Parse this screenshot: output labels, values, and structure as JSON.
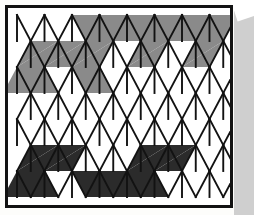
{
  "figure": {
    "title": "Triangular lattice grid with shaded regions",
    "type": "triangular-grid",
    "columns": 8,
    "rows": 7,
    "background_color": "#ffffff",
    "line_color": "#121212",
    "frame_color": "#121212",
    "page_color": "#fdfdfb",
    "scan_gutter_color": "#cfcfcf",
    "shade_colors": {
      "gray": "#8a8a8a",
      "dark": "#2b2b2b",
      "empty": "#ffffff"
    },
    "geometry": {
      "origin_x": 14,
      "origin_y": 12,
      "cell_width": 27.5,
      "cell_height": 26.0,
      "stroke_width": 1.9,
      "frame_x": 5,
      "frame_y": 5,
      "frame_width": 228,
      "frame_height": 203,
      "frame_stroke": 3
    },
    "legend": [
      {
        "key": "gray",
        "label": "Gray shaded triangle",
        "color": "#8a8a8a"
      },
      {
        "key": "dark",
        "label": "Dark shaded triangle",
        "color": "#2b2b2b"
      },
      {
        "key": "empty",
        "label": "Unshaded triangle",
        "color": "#ffffff"
      }
    ],
    "shaded_cells": [
      {
        "row": 0,
        "col": 2,
        "dir": "up",
        "shade": "gray"
      },
      {
        "row": 0,
        "col": 3,
        "dir": "down",
        "shade": "gray"
      },
      {
        "row": 0,
        "col": 3,
        "dir": "up",
        "shade": "gray"
      },
      {
        "row": 0,
        "col": 4,
        "dir": "down",
        "shade": "gray"
      },
      {
        "row": 0,
        "col": 4,
        "dir": "up",
        "shade": "gray"
      },
      {
        "row": 0,
        "col": 5,
        "dir": "down",
        "shade": "gray"
      },
      {
        "row": 0,
        "col": 5,
        "dir": "up",
        "shade": "gray"
      },
      {
        "row": 0,
        "col": 6,
        "dir": "down",
        "shade": "gray"
      },
      {
        "row": 0,
        "col": 6,
        "dir": "up",
        "shade": "gray"
      },
      {
        "row": 0,
        "col": 7,
        "dir": "down",
        "shade": "gray"
      },
      {
        "row": 0,
        "col": 7,
        "dir": "up",
        "shade": "gray"
      },
      {
        "row": 1,
        "col": 0,
        "dir": "up",
        "shade": "gray"
      },
      {
        "row": 1,
        "col": 1,
        "dir": "down",
        "shade": "gray"
      },
      {
        "row": 1,
        "col": 1,
        "dir": "up",
        "shade": "gray"
      },
      {
        "row": 1,
        "col": 2,
        "dir": "down",
        "shade": "gray"
      },
      {
        "row": 1,
        "col": 2,
        "dir": "up",
        "shade": "gray"
      },
      {
        "row": 1,
        "col": 3,
        "dir": "down",
        "shade": "gray"
      },
      {
        "row": 1,
        "col": 4,
        "dir": "up",
        "shade": "gray"
      },
      {
        "row": 1,
        "col": 5,
        "dir": "down",
        "shade": "gray"
      },
      {
        "row": 1,
        "col": 6,
        "dir": "up",
        "shade": "gray"
      },
      {
        "row": 1,
        "col": 7,
        "dir": "down",
        "shade": "gray"
      },
      {
        "row": 2,
        "col": 0,
        "dir": "down",
        "shade": "gray"
      },
      {
        "row": 2,
        "col": 0,
        "dir": "up",
        "shade": "gray"
      },
      {
        "row": 2,
        "col": 1,
        "dir": "down",
        "shade": "gray"
      },
      {
        "row": 2,
        "col": 2,
        "dir": "up",
        "shade": "gray"
      },
      {
        "row": 2,
        "col": 3,
        "dir": "down",
        "shade": "gray"
      },
      {
        "row": 5,
        "col": 0,
        "dir": "up",
        "shade": "dark"
      },
      {
        "row": 5,
        "col": 1,
        "dir": "down",
        "shade": "dark"
      },
      {
        "row": 5,
        "col": 1,
        "dir": "up",
        "shade": "dark"
      },
      {
        "row": 5,
        "col": 2,
        "dir": "down",
        "shade": "dark"
      },
      {
        "row": 5,
        "col": 4,
        "dir": "up",
        "shade": "dark"
      },
      {
        "row": 5,
        "col": 5,
        "dir": "down",
        "shade": "dark"
      },
      {
        "row": 5,
        "col": 5,
        "dir": "up",
        "shade": "dark"
      },
      {
        "row": 5,
        "col": 6,
        "dir": "down",
        "shade": "dark"
      },
      {
        "row": 6,
        "col": 0,
        "dir": "down",
        "shade": "dark"
      },
      {
        "row": 6,
        "col": 0,
        "dir": "up",
        "shade": "dark"
      },
      {
        "row": 6,
        "col": 1,
        "dir": "down",
        "shade": "dark"
      },
      {
        "row": 6,
        "col": 2,
        "dir": "up",
        "shade": "dark"
      },
      {
        "row": 6,
        "col": 3,
        "dir": "down",
        "shade": "dark"
      },
      {
        "row": 6,
        "col": 3,
        "dir": "up",
        "shade": "dark"
      },
      {
        "row": 6,
        "col": 4,
        "dir": "down",
        "shade": "dark"
      },
      {
        "row": 6,
        "col": 4,
        "dir": "up",
        "shade": "dark"
      },
      {
        "row": 6,
        "col": 5,
        "dir": "down",
        "shade": "dark"
      }
    ]
  }
}
